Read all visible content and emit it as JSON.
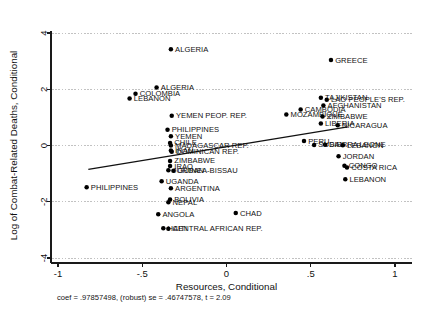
{
  "chart_data": {
    "type": "scatter",
    "title": "",
    "xlabel": "Resources, Conditional",
    "ylabel": "Log of Combat-Related Deaths, Conditional",
    "xlim": [
      -1.0,
      1.0
    ],
    "ylim": [
      -4.0,
      4.0
    ],
    "xticks": [
      -1,
      -0.5,
      0,
      0.5,
      1
    ],
    "xticklabels": [
      "-1",
      "-.5",
      "0",
      ".5",
      "1"
    ],
    "yticks": [
      4,
      2,
      0,
      -2,
      -4
    ],
    "yticklabels": [
      "4",
      "2",
      "0",
      "-2",
      "-4"
    ],
    "grid": "horizontal-dotted",
    "legend": "none",
    "fit_line": {
      "x0": -0.82,
      "y0": -0.85,
      "x1": 0.72,
      "y1": 0.66
    },
    "annotation": "coef = .97857498, (robust) se = .46747578, t = 2.09",
    "points": [
      {
        "label": "ALGERIA",
        "x": -0.33,
        "y": 3.42,
        "side": "right"
      },
      {
        "label": "GREECE",
        "x": 0.62,
        "y": 3.04,
        "side": "right"
      },
      {
        "label": "ALGERIA",
        "x": -0.415,
        "y": 2.06,
        "side": "right"
      },
      {
        "label": "COLOMBIA",
        "x": -0.54,
        "y": 1.84,
        "side": "right"
      },
      {
        "label": "LEBANON",
        "x": -0.575,
        "y": 1.67,
        "side": "right"
      },
      {
        "label": "TAJIKISTAN",
        "x": 0.56,
        "y": 1.7,
        "side": "right"
      },
      {
        "label": "LAO PEOPLE'S REP.",
        "x": 0.595,
        "y": 1.63,
        "side": "right"
      },
      {
        "label": "AFGHANISTAN",
        "x": 0.575,
        "y": 1.42,
        "side": "right"
      },
      {
        "label": "CAMBODIA",
        "x": 0.44,
        "y": 1.28,
        "side": "right"
      },
      {
        "label": "MOZAMBIQUE",
        "x": 0.355,
        "y": 1.1,
        "side": "right"
      },
      {
        "label": "ZIMBABWE",
        "x": 0.57,
        "y": 1.03,
        "side": "right"
      },
      {
        "label": "YEMEN PEOP. REP.",
        "x": -0.325,
        "y": 1.06,
        "side": "right"
      },
      {
        "label": "LIBERIA",
        "x": 0.56,
        "y": 0.78,
        "side": "right"
      },
      {
        "label": "NICARAGUA",
        "x": 0.66,
        "y": 0.72,
        "side": "right"
      },
      {
        "label": "PHILIPPINES",
        "x": -0.35,
        "y": 0.56,
        "side": "right"
      },
      {
        "label": "YEMEN",
        "x": -0.33,
        "y": 0.33,
        "side": "right"
      },
      {
        "label": "CHILE",
        "x": -0.335,
        "y": 0.09,
        "side": "right"
      },
      {
        "label": "MADAGASCAR REP.",
        "x": -0.33,
        "y": 0.0,
        "side": "right"
      },
      {
        "label": "PERU",
        "x": 0.46,
        "y": 0.16,
        "side": "right"
      },
      {
        "label": "SIERRA LEONE",
        "x": 0.585,
        "y": 0.03,
        "side": "right"
      },
      {
        "label": "SUDAN",
        "x": 0.52,
        "y": 0.02,
        "side": "right"
      },
      {
        "label": "LEBANON",
        "x": 0.69,
        "y": 0.01,
        "side": "right"
      },
      {
        "label": "IRAN",
        "x": -0.33,
        "y": -0.18,
        "side": "right"
      },
      {
        "label": "DOMINICAN REP.",
        "x": -0.325,
        "y": -0.22,
        "side": "right"
      },
      {
        "label": "JORDAN",
        "x": 0.665,
        "y": -0.38,
        "side": "right"
      },
      {
        "label": "ZIMBABWE",
        "x": -0.335,
        "y": -0.55,
        "side": "right"
      },
      {
        "label": "IRAQ",
        "x": -0.335,
        "y": -0.73,
        "side": "right"
      },
      {
        "label": "CONGO",
        "x": 0.7,
        "y": -0.72,
        "side": "right"
      },
      {
        "label": "COSTA RICA",
        "x": 0.715,
        "y": -0.78,
        "side": "right"
      },
      {
        "label": "JORDAN",
        "x": -0.345,
        "y": -0.88,
        "side": "right"
      },
      {
        "label": "GUINEA-BISSAU",
        "x": -0.315,
        "y": -0.9,
        "side": "right"
      },
      {
        "label": "LEBANON",
        "x": 0.705,
        "y": -1.2,
        "side": "right"
      },
      {
        "label": "UGANDA",
        "x": -0.385,
        "y": -1.27,
        "side": "right"
      },
      {
        "label": "PHILIPPINES",
        "x": -0.83,
        "y": -1.48,
        "side": "right"
      },
      {
        "label": "ARGENTINA",
        "x": -0.33,
        "y": -1.52,
        "side": "right"
      },
      {
        "label": "BOLIVIA",
        "x": -0.335,
        "y": -1.92,
        "side": "right"
      },
      {
        "label": "NEPAL",
        "x": -0.345,
        "y": -2.02,
        "side": "right"
      },
      {
        "label": "ANGOLA",
        "x": -0.405,
        "y": -2.44,
        "side": "right"
      },
      {
        "label": "CHAD",
        "x": 0.055,
        "y": -2.4,
        "side": "right"
      },
      {
        "label": "HAITI",
        "x": -0.375,
        "y": -2.94,
        "side": "right"
      },
      {
        "label": "CENTRAL AFRICAN REP.",
        "x": -0.345,
        "y": -2.96,
        "side": "right"
      }
    ]
  }
}
